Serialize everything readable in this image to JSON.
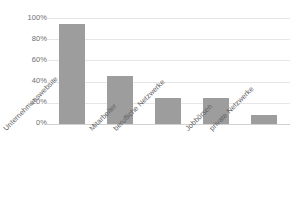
{
  "chart_data": {
    "type": "bar",
    "title": "",
    "subtitle": "",
    "xlabel": "",
    "ylabel": "",
    "categories": [
      "Unternehmenswebsite",
      "Mitarbeiter",
      "berufliche Netzwerke",
      "Jobbörsen",
      "private Netzwerke"
    ],
    "values": [
      94,
      45,
      25,
      25,
      9
    ],
    "value_labels": [
      "94%",
      "45%",
      "25%",
      "25%",
      "9%"
    ],
    "ylim": [
      0,
      100
    ],
    "ytick_values": [
      0,
      20,
      40,
      60,
      80,
      100
    ],
    "ytick_labels": [
      "0%",
      "20%",
      "40%",
      "60%",
      "80%",
      "100%"
    ],
    "grid": true,
    "grid_axis": "y",
    "legend": false,
    "legend_position": "none",
    "series": [
      {
        "name": "Anteil",
        "values": [
          94,
          45,
          25,
          25,
          9
        ]
      }
    ],
    "annotations": [],
    "colors": {
      "bar": "#9d9d9d",
      "gridline": "#e6e6e6",
      "axis": "#d0d0d0",
      "tick_text": "#6f6f6f",
      "category_text": "#5f5f5f",
      "background": "#ffffff"
    }
  }
}
